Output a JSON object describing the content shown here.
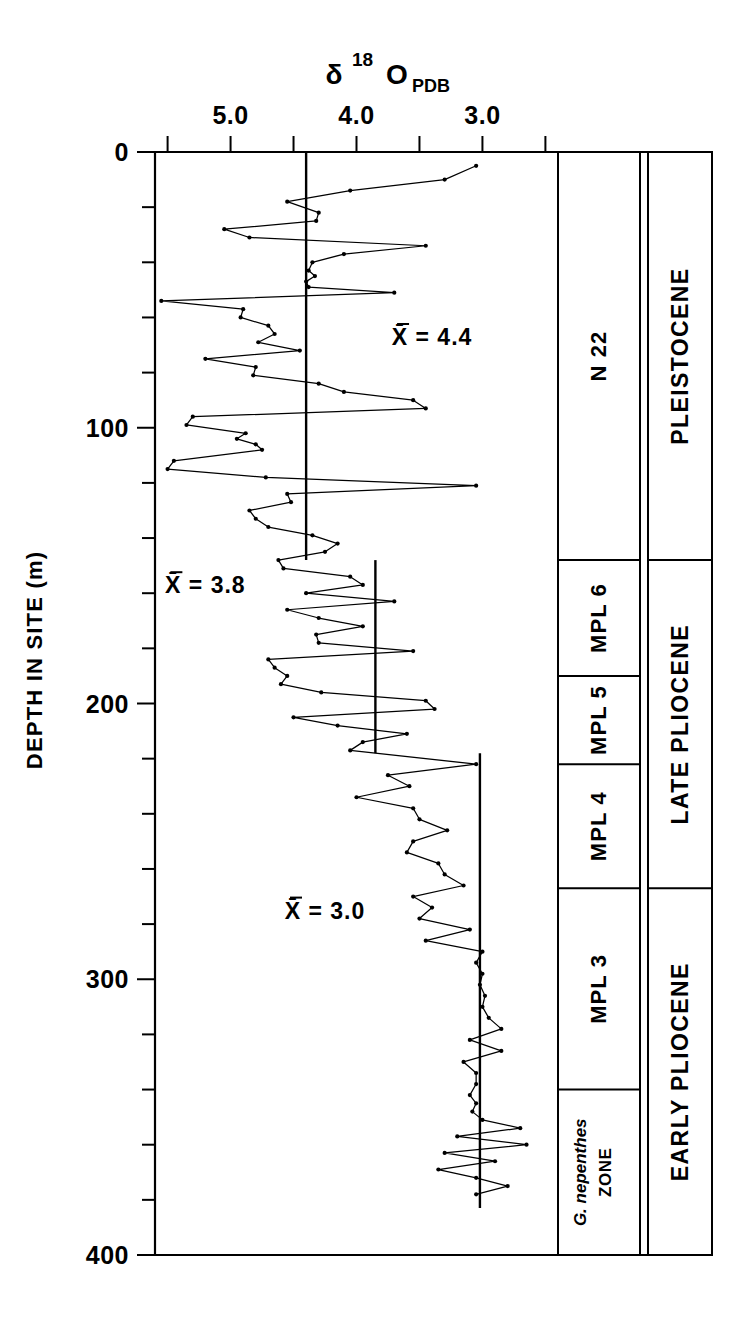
{
  "figure": {
    "axis_title_main": "δ",
    "axis_title_sup": "18",
    "axis_title_el": "O",
    "axis_title_sub": "PDB",
    "y_axis_label": "DEPTH IN SITE (m)"
  },
  "chart_data": {
    "type": "line",
    "xlabel": "δ 18 O PDB",
    "ylabel": "DEPTH IN SITE (m)",
    "orientation": "vertical-depth",
    "x_axis_position": "top",
    "x_axis_reversed": true,
    "xlim": [
      5.6,
      2.4
    ],
    "ylim": [
      400,
      0
    ],
    "grid": false,
    "x_tick_labels": [
      "5.0",
      "4.0",
      "3.0"
    ],
    "x_tick_values": [
      5.0,
      4.0,
      3.0
    ],
    "x_minor_tick_values": [
      5.5,
      5.0,
      4.5,
      4.0,
      3.5,
      3.0,
      2.5
    ],
    "y_tick_labels": [
      "0",
      "100",
      "200",
      "300",
      "400"
    ],
    "y_tick_values": [
      0,
      100,
      200,
      300,
      400
    ],
    "y_minor_tick_step": 20,
    "series": [
      {
        "name": "delta18O PDB",
        "marker": "dot",
        "points": [
          [
            3.05,
            5
          ],
          [
            3.3,
            10
          ],
          [
            4.05,
            14
          ],
          [
            4.55,
            18
          ],
          [
            4.3,
            22
          ],
          [
            4.32,
            25
          ],
          [
            5.05,
            28
          ],
          [
            4.85,
            31
          ],
          [
            3.45,
            34
          ],
          [
            4.1,
            37
          ],
          [
            4.35,
            40
          ],
          [
            4.38,
            43
          ],
          [
            4.33,
            45
          ],
          [
            4.4,
            47
          ],
          [
            4.38,
            49
          ],
          [
            3.7,
            51
          ],
          [
            5.55,
            54
          ],
          [
            4.9,
            57
          ],
          [
            4.92,
            60
          ],
          [
            4.7,
            63
          ],
          [
            4.65,
            66
          ],
          [
            4.78,
            69
          ],
          [
            4.45,
            72
          ],
          [
            5.2,
            75
          ],
          [
            4.8,
            78
          ],
          [
            4.82,
            81
          ],
          [
            4.3,
            84
          ],
          [
            4.1,
            87
          ],
          [
            3.55,
            90
          ],
          [
            3.45,
            93
          ],
          [
            5.3,
            96
          ],
          [
            5.35,
            99
          ],
          [
            4.88,
            102
          ],
          [
            4.95,
            104
          ],
          [
            4.8,
            106
          ],
          [
            4.75,
            108
          ],
          [
            5.45,
            112
          ],
          [
            5.5,
            115
          ],
          [
            4.72,
            118
          ],
          [
            3.05,
            121
          ],
          [
            4.55,
            124
          ],
          [
            4.52,
            127
          ],
          [
            4.85,
            130
          ],
          [
            4.8,
            133
          ],
          [
            4.7,
            136
          ],
          [
            4.35,
            139
          ],
          [
            4.15,
            142
          ],
          [
            4.25,
            145
          ],
          [
            4.62,
            148
          ],
          [
            4.58,
            151
          ],
          [
            4.05,
            154
          ],
          [
            3.95,
            157
          ],
          [
            4.4,
            160
          ],
          [
            3.7,
            163
          ],
          [
            4.55,
            166
          ],
          [
            4.3,
            169
          ],
          [
            3.95,
            172
          ],
          [
            4.32,
            175
          ],
          [
            4.3,
            178
          ],
          [
            3.55,
            181
          ],
          [
            4.7,
            184
          ],
          [
            4.65,
            187
          ],
          [
            4.55,
            190
          ],
          [
            4.6,
            193
          ],
          [
            4.28,
            196
          ],
          [
            3.45,
            199
          ],
          [
            3.38,
            202
          ],
          [
            4.5,
            205
          ],
          [
            4.15,
            208
          ],
          [
            3.6,
            211
          ],
          [
            3.95,
            214
          ],
          [
            4.05,
            217
          ],
          [
            3.05,
            222
          ],
          [
            3.75,
            226
          ],
          [
            3.58,
            230
          ],
          [
            4.0,
            234
          ],
          [
            3.55,
            238
          ],
          [
            3.5,
            242
          ],
          [
            3.28,
            246
          ],
          [
            3.55,
            250
          ],
          [
            3.6,
            254
          ],
          [
            3.35,
            258
          ],
          [
            3.3,
            262
          ],
          [
            3.15,
            266
          ],
          [
            3.55,
            270
          ],
          [
            3.4,
            274
          ],
          [
            3.5,
            278
          ],
          [
            3.1,
            282
          ],
          [
            3.45,
            286
          ],
          [
            3.0,
            290
          ],
          [
            3.05,
            294
          ],
          [
            3.0,
            298
          ],
          [
            3.02,
            302
          ],
          [
            2.98,
            306
          ],
          [
            3.0,
            310
          ],
          [
            2.95,
            314
          ],
          [
            2.85,
            318
          ],
          [
            3.1,
            322
          ],
          [
            2.85,
            326
          ],
          [
            3.15,
            330
          ],
          [
            3.05,
            334
          ],
          [
            3.05,
            338
          ],
          [
            3.1,
            342
          ],
          [
            3.05,
            345
          ],
          [
            3.08,
            348
          ],
          [
            3.0,
            351
          ],
          [
            2.7,
            354
          ],
          [
            3.2,
            357
          ],
          [
            2.65,
            360
          ],
          [
            3.3,
            363
          ],
          [
            2.9,
            366
          ],
          [
            3.35,
            369
          ],
          [
            3.05,
            372
          ],
          [
            2.8,
            375
          ],
          [
            3.05,
            378
          ]
        ]
      }
    ],
    "mean_segments": [
      {
        "label": "X̄ = 4.4",
        "value": 4.4,
        "depth_from": 0,
        "depth_to": 148,
        "label_x": 3.4,
        "label_y": 70
      },
      {
        "label": "X̄ = 3.8",
        "value": 3.85,
        "depth_from": 148,
        "depth_to": 218,
        "label_x": 5.2,
        "label_y": 160
      },
      {
        "label": "X̄ = 3.0",
        "value": 3.02,
        "depth_from": 218,
        "depth_to": 383,
        "label_x": 4.25,
        "label_y": 278
      }
    ]
  },
  "zone_column": {
    "header": "ZONE",
    "rows": [
      {
        "label": "N 22",
        "depth_from": 0,
        "depth_to": 148
      },
      {
        "label": "MPL 6",
        "depth_from": 148,
        "depth_to": 190
      },
      {
        "label": "MPL 5",
        "depth_from": 190,
        "depth_to": 222
      },
      {
        "label": "MPL 4",
        "depth_from": 222,
        "depth_to": 267
      },
      {
        "label": "MPL 3",
        "depth_from": 267,
        "depth_to": 340
      },
      {
        "label_italic": "G. nepenthes",
        "label": "ZONE",
        "depth_from": 340,
        "depth_to": 400
      }
    ]
  },
  "epoch_column": {
    "rows": [
      {
        "label": "PLEISTOCENE",
        "depth_from": 0,
        "depth_to": 148
      },
      {
        "label": "LATE PLIOCENE",
        "depth_from": 148,
        "depth_to": 267
      },
      {
        "label": "EARLY PLIOCENE",
        "depth_from": 267,
        "depth_to": 400
      }
    ]
  },
  "colors": {
    "ink": "#000000",
    "paper": "#ffffff"
  }
}
